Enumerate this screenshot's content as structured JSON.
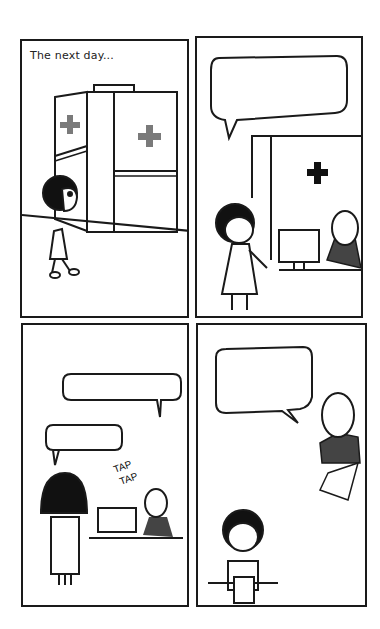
{
  "comic": {
    "layout": "2x2 grid",
    "panels": [
      {
        "id": 1,
        "caption": "The next day...",
        "scene": "Girl walking toward medical clinic entrance with red-cross signs",
        "speech_bubbles": []
      },
      {
        "id": 2,
        "caption": "",
        "scene": "Girl speaking to receptionist at desk with computer; black cross on wall",
        "speech_bubbles": [
          {
            "speaker": "girl",
            "text": ""
          }
        ]
      },
      {
        "id": 3,
        "caption": "",
        "scene": "Girl from behind at reception; receptionist typing",
        "sound_effect": [
          "TAP",
          "TAP"
        ],
        "speech_bubbles": [
          {
            "speaker": "receptionist",
            "text": ""
          },
          {
            "speaker": "girl",
            "text": ""
          }
        ]
      },
      {
        "id": 4,
        "caption": "",
        "scene": "Receptionist hands form; girl looks down at paper",
        "speech_bubbles": [
          {
            "speaker": "receptionist",
            "text": ""
          }
        ]
      }
    ],
    "colors": {
      "ink": "#1a1a1a",
      "cross_gray": "#7a7a7a",
      "uniform": "#444444",
      "background": "#ffffff"
    }
  }
}
